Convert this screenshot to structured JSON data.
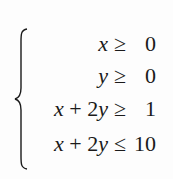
{
  "system": {
    "type": "system-of-inequalities",
    "rows": [
      {
        "lhs_parts": [
          {
            "t": "x",
            "v": true
          }
        ],
        "relation": "≥",
        "rhs": "0"
      },
      {
        "lhs_parts": [
          {
            "t": "y",
            "v": true
          }
        ],
        "relation": "≥",
        "rhs": "0"
      },
      {
        "lhs_parts": [
          {
            "t": "x",
            "v": true
          },
          {
            "t": " + 2",
            "v": false
          },
          {
            "t": "y",
            "v": true
          }
        ],
        "relation": "≥",
        "rhs": "1"
      },
      {
        "lhs_parts": [
          {
            "t": "x",
            "v": true
          },
          {
            "t": " + 2",
            "v": false
          },
          {
            "t": "y",
            "v": true
          }
        ],
        "relation": "≤",
        "rhs": "10"
      }
    ],
    "plain": [
      "x ≥ 0",
      "y ≥ 0",
      "x + 2y ≥ 1",
      "x + 2y ≤ 10"
    ]
  },
  "colors": {
    "background": "#fdfdfd",
    "text": "#1a1a1a"
  }
}
